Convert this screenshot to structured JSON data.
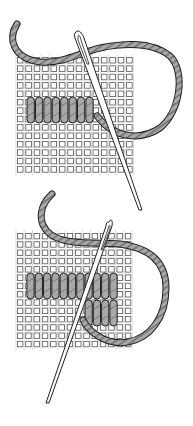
{
  "figure": {
    "colors": {
      "background": "#ffffff",
      "mesh_fill": "#ffffff",
      "mesh_stroke": "#555555",
      "yarn_fill": "#a8a8a8",
      "yarn_stroke": "#222222",
      "yarn_stripe": "#6a6a6a",
      "needle_fill": "#ffffff",
      "needle_stroke": "#222222"
    },
    "panels": [
      {
        "id": "step-1",
        "label": "Step 1",
        "canvas": {
          "x": 16,
          "y": 56,
          "cols": 14,
          "rows": 14,
          "pitch": 8.4
        },
        "stitch_rows": [
          {
            "start_col": 1,
            "count": 8,
            "top": 97,
            "height": 26
          }
        ]
      },
      {
        "id": "step-2",
        "label": "Step 2",
        "canvas": {
          "x": 16,
          "y": 232,
          "cols": 14,
          "rows": 14,
          "pitch": 8.3
        },
        "stitch_rows": [
          {
            "start_col": 1,
            "count": 11,
            "top": 273,
            "height": 26
          },
          {
            "start_col": 8,
            "count": 4,
            "top": 300,
            "height": 26
          }
        ]
      }
    ]
  }
}
